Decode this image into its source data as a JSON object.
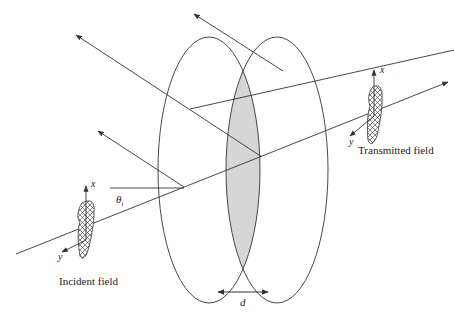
{
  "figure": {
    "colors": {
      "line": "#333333",
      "overlap_fill": "#d6d6d6",
      "hatch": "#333333",
      "background": "#ffffff"
    }
  },
  "labels": {
    "incident_field": "Incident field",
    "transmitted_field": "Transmitted field",
    "incident_x": "x",
    "incident_y": "y",
    "transmitted_x": "x",
    "transmitted_y": "y",
    "theta": "θ",
    "theta_sub": "i",
    "thickness": "d"
  }
}
